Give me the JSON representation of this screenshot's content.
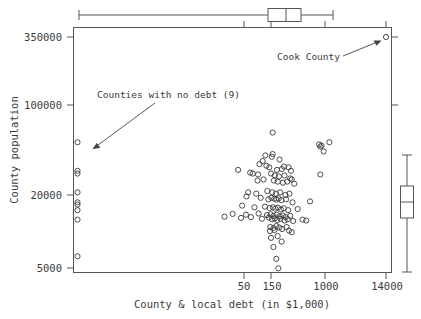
{
  "chart_data": {
    "type": "scatter",
    "title": "",
    "xlabel": "County & local debt (in $1,000)",
    "ylabel": "County population",
    "x_scale": "log",
    "y_scale": "log",
    "x_ticks": [
      "50",
      "150",
      "1000",
      "14000"
    ],
    "x_tick_values": [
      50,
      150,
      1000,
      14000
    ],
    "y_ticks": [
      "350000",
      "100000",
      "20000",
      "5000"
    ],
    "y_tick_values": [
      350000,
      100000,
      20000,
      5000
    ],
    "grid": false,
    "legend": "none",
    "annotations": [
      {
        "text": "Cook County",
        "points_to": "top-right outlier",
        "x": 14000,
        "y": 350000
      },
      {
        "text": "Counties with no debt (9)",
        "points_to": "left column of zero-debt counties",
        "count": 9
      }
    ],
    "marginal_boxplots": {
      "top": {
        "axis": "x",
        "orientation": "horizontal",
        "whisker_low": 30,
        "q1": 110,
        "median": 160,
        "q3": 290,
        "whisker_high": 1400
      },
      "right": {
        "axis": "y",
        "orientation": "vertical",
        "whisker_low": 6400,
        "q1": 13500,
        "median": 19500,
        "q3": 29000,
        "whisker_high": 75000
      }
    },
    "zero_debt_points": {
      "note": "Nine counties with no debt plotted along the left frame edge",
      "y_values": [
        52000,
        31000,
        29500,
        21000,
        17500,
        16800,
        15200,
        12800,
        6600
      ]
    },
    "points": [
      [
        14000,
        350000
      ],
      [
        41,
        31500
      ],
      [
        160,
        62000
      ],
      [
        1000,
        50000
      ],
      [
        1200,
        44000
      ],
      [
        1100,
        49000
      ],
      [
        1050,
        48000
      ],
      [
        1500,
        52000
      ],
      [
        160,
        42000
      ],
      [
        155,
        40000
      ],
      [
        120,
        41000
      ],
      [
        210,
        38000
      ],
      [
        108,
        37000
      ],
      [
        95,
        35000
      ],
      [
        125,
        34000
      ],
      [
        140,
        33000
      ],
      [
        250,
        33500
      ],
      [
        300,
        33000
      ],
      [
        190,
        31500
      ],
      [
        230,
        32000
      ],
      [
        330,
        31000
      ],
      [
        66,
        30000
      ],
      [
        73,
        29500
      ],
      [
        90,
        29000
      ],
      [
        150,
        29500
      ],
      [
        175,
        28500
      ],
      [
        205,
        28000
      ],
      [
        255,
        28500
      ],
      [
        1050,
        29000
      ],
      [
        320,
        27000
      ],
      [
        340,
        26500
      ],
      [
        88,
        26000
      ],
      [
        112,
        26500
      ],
      [
        168,
        26000
      ],
      [
        196,
        25500
      ],
      [
        240,
        25000
      ],
      [
        285,
        25500
      ],
      [
        375,
        24500
      ],
      [
        61,
        21000
      ],
      [
        84,
        20500
      ],
      [
        130,
        21500
      ],
      [
        158,
        21000
      ],
      [
        182,
        20500
      ],
      [
        215,
        21000
      ],
      [
        265,
        20000
      ],
      [
        310,
        20500
      ],
      [
        57,
        19500
      ],
      [
        100,
        19000
      ],
      [
        135,
        18500
      ],
      [
        152,
        19000
      ],
      [
        171,
        18700
      ],
      [
        186,
        18400
      ],
      [
        203,
        18800
      ],
      [
        226,
        18200
      ],
      [
        272,
        18500
      ],
      [
        350,
        17500
      ],
      [
        700,
        17800
      ],
      [
        48,
        16500
      ],
      [
        78,
        16000
      ],
      [
        118,
        16200
      ],
      [
        142,
        15800
      ],
      [
        162,
        16000
      ],
      [
        178,
        15600
      ],
      [
        198,
        15900
      ],
      [
        222,
        15400
      ],
      [
        248,
        15700
      ],
      [
        295,
        15200
      ],
      [
        430,
        15500
      ],
      [
        33,
        14200
      ],
      [
        56,
        14000
      ],
      [
        92,
        14300
      ],
      [
        128,
        13900
      ],
      [
        148,
        14100
      ],
      [
        166,
        13700
      ],
      [
        188,
        14000
      ],
      [
        212,
        13600
      ],
      [
        238,
        13800
      ],
      [
        268,
        13400
      ],
      [
        320,
        13700
      ],
      [
        24,
        13500
      ],
      [
        46,
        13200
      ],
      [
        68,
        13400
      ],
      [
        105,
        13000
      ],
      [
        138,
        13300
      ],
      [
        156,
        12900
      ],
      [
        174,
        13100
      ],
      [
        192,
        12700
      ],
      [
        218,
        13000
      ],
      [
        256,
        12600
      ],
      [
        290,
        12900
      ],
      [
        360,
        12500
      ],
      [
        520,
        12800
      ],
      [
        600,
        12600
      ],
      [
        146,
        11200
      ],
      [
        165,
        11000
      ],
      [
        185,
        11400
      ],
      [
        208,
        11100
      ],
      [
        232,
        10800
      ],
      [
        278,
        11200
      ],
      [
        144,
        10400
      ],
      [
        172,
        10600
      ],
      [
        150,
        9200
      ],
      [
        195,
        9500
      ],
      [
        305,
        10500
      ],
      [
        340,
        10200
      ],
      [
        228,
        8600
      ],
      [
        165,
        7800
      ],
      [
        185,
        6300
      ],
      [
        200,
        5300
      ]
    ]
  }
}
